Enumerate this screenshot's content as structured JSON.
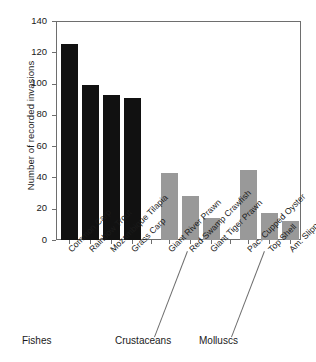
{
  "chart_data": {
    "type": "bar",
    "title": "",
    "subtitle": "",
    "xlabel": "",
    "ylabel": "Number of recorded invasions",
    "ylim": [
      0,
      140
    ],
    "yticks": [
      0,
      20,
      40,
      60,
      80,
      100,
      120,
      140
    ],
    "grid": false,
    "legend": null,
    "categories": [
      "Common Carp",
      "Rainbow Trout",
      "Mozambique Tilapia",
      "Grass Carp",
      "Giant River Prawn",
      "Red Swamp Crawfish",
      "Giant Tiger Prawn",
      "Pac. Cupped Oyster",
      "Top Shell",
      "Am. Slipper Limpet"
    ],
    "values": [
      125,
      99,
      93,
      91,
      43,
      28,
      14,
      45,
      17,
      12
    ],
    "bar_colors": [
      "#111111",
      "#111111",
      "#111111",
      "#111111",
      "#999999",
      "#999999",
      "#999999",
      "#999999",
      "#999999",
      "#999999"
    ],
    "groups": [
      {
        "label": "Fishes",
        "categories": [
          "Common Carp",
          "Rainbow Trout",
          "Mozambique Tilapia",
          "Grass Carp"
        ],
        "color": "#111111"
      },
      {
        "label": "Crustaceans",
        "categories": [
          "Giant River Prawn",
          "Red Swamp Crawfish",
          "Giant Tiger Prawn"
        ],
        "color": "#999999"
      },
      {
        "label": "Molluscs",
        "categories": [
          "Pac. Cupped Oyster",
          "Top Shell",
          "Am. Slipper Limpet"
        ],
        "color": "#999999"
      }
    ],
    "series": [
      {
        "name": "Number of recorded invasions",
        "values": [
          125,
          99,
          93,
          91,
          43,
          28,
          14,
          45,
          17,
          12
        ]
      }
    ]
  },
  "axis": {
    "y_title": "Number of recorded invasions",
    "y_tick_labels": [
      "140",
      "120",
      "100",
      "80",
      "60",
      "40",
      "20",
      "0"
    ]
  },
  "group_labels": {
    "fishes": "Fishes",
    "crustaceans": "Crustaceans",
    "molluscs": "Molluscs"
  },
  "caption_remnant": ""
}
